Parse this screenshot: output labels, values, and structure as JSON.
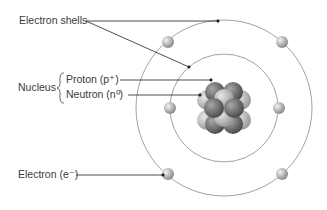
{
  "labels": {
    "electron_shells": "Electron shells",
    "nucleus": "Nucleus",
    "proton": "Proton (p⁺)",
    "neutron": "Neutron (n⁰)",
    "electron": "Electron (e⁻)"
  },
  "colors": {
    "orbit": "#8a8a8a",
    "leader": "#222222",
    "electron": "#b0b0b0",
    "proton": "#7a7a7a",
    "neutron": "#c4c4c4"
  }
}
